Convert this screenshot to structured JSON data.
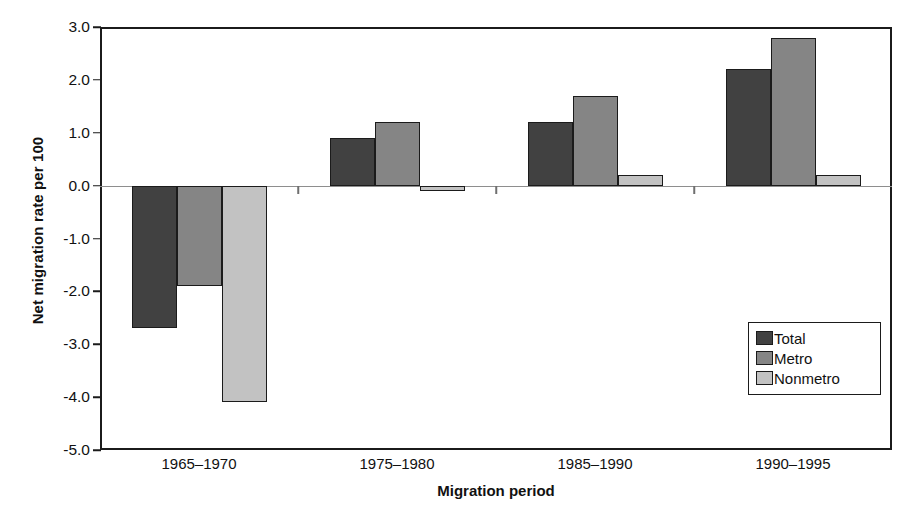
{
  "chart_data": {
    "type": "bar",
    "title": "",
    "xlabel": "Migration period",
    "ylabel": "Net migration rate per 100",
    "categories": [
      "1965–1970",
      "1975–1980",
      "1985–1990",
      "1990–1995"
    ],
    "series": [
      {
        "name": "Total",
        "color": "#414141",
        "values": [
          -2.7,
          0.9,
          1.2,
          2.2
        ]
      },
      {
        "name": "Metro",
        "color": "#858585",
        "values": [
          -1.9,
          1.2,
          1.7,
          2.8
        ]
      },
      {
        "name": "Nonmetro",
        "color": "#c2c2c2",
        "values": [
          -4.1,
          -0.1,
          0.2,
          0.2
        ]
      }
    ],
    "ylim": [
      -5.0,
      3.0
    ],
    "ytick_labels": [
      "3.0",
      "2.0",
      "1.0",
      "0.0",
      "-1.0",
      "-2.0",
      "-3.0",
      "-4.0",
      "-5.0"
    ],
    "ytick_values": [
      3.0,
      2.0,
      1.0,
      0.0,
      -1.0,
      -2.0,
      -3.0,
      -4.0,
      -5.0
    ],
    "grid": false,
    "zero_line": true,
    "legend_position": "inside-lower-right"
  },
  "figure": {
    "title_sliver": "",
    "background_color": "#ffffff",
    "frame_color": "#1b1b1b"
  }
}
